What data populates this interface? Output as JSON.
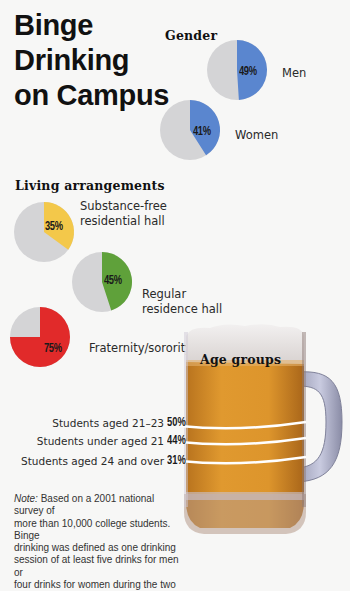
{
  "title_lines": [
    "Binge",
    "Drinking",
    "on Campus"
  ],
  "sections": {
    "gender": "Gender",
    "living": "Living arrangements",
    "age": "Age groups"
  },
  "gender": [
    {
      "label": "Men",
      "pct": "49%",
      "value": 49,
      "color": "#5a86cf"
    },
    {
      "label": "Women",
      "pct": "41%",
      "value": 41,
      "color": "#5a86cf"
    }
  ],
  "living": [
    {
      "label_lines": [
        "Substance-free",
        "residential hall"
      ],
      "pct": "35%",
      "value": 35,
      "color": "#f3c84a"
    },
    {
      "label_lines": [
        "Regular",
        "residence hall"
      ],
      "pct": "45%",
      "value": 45,
      "color": "#5fa13a"
    },
    {
      "label_lines": [
        "Fraternity/sorority"
      ],
      "pct": "75%",
      "value": 75,
      "color": "#e12a2a"
    }
  ],
  "age": [
    {
      "label": "Students aged 21–23",
      "pct": "50%",
      "value": 50
    },
    {
      "label": "Students under aged 21",
      "pct": "44%",
      "value": 44
    },
    {
      "label": "Students aged 24 and over",
      "pct": "31%",
      "value": 31
    }
  ],
  "note": {
    "prefix": "Note:",
    "lines": [
      " Based on a 2001 national survey of",
      "more than 10,000 college students. Binge",
      "drinking was defined as one drinking",
      "session of at least five drinks for men or",
      "four drinks for women during the two"
    ]
  },
  "colors": {
    "pie_bg": "#d4d4d6",
    "beer": "#d98f2a",
    "foam": "#e9e6e6"
  },
  "chart_data": [
    {
      "type": "pie",
      "title": "Gender",
      "categories": [
        "Men",
        "Women"
      ],
      "values": [
        49,
        41
      ],
      "unit": "% binge drinkers"
    },
    {
      "type": "pie",
      "title": "Living arrangements",
      "categories": [
        "Substance-free residential hall",
        "Regular residence hall",
        "Fraternity/sorority"
      ],
      "values": [
        35,
        45,
        75
      ],
      "unit": "% binge drinkers"
    },
    {
      "type": "bar",
      "title": "Age groups",
      "categories": [
        "Students aged 21–23",
        "Students under aged 21",
        "Students aged 24 and over"
      ],
      "values": [
        50,
        44,
        31
      ],
      "unit": "%"
    }
  ]
}
